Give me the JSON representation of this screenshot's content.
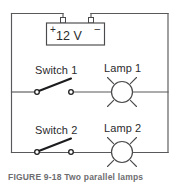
{
  "figure": {
    "caption": "FIGURE 9-18   Two parallel lamps",
    "circuit_type": "parallel circuit"
  },
  "battery": {
    "voltage_label": "12 V",
    "positive_sign": "+",
    "negative_sign": "–"
  },
  "branches": [
    {
      "switch_label": "Switch 1",
      "lamp_label": "Lamp 1",
      "switch_state": "open"
    },
    {
      "switch_label": "Switch 2",
      "lamp_label": "Lamp 2",
      "switch_state": "open"
    }
  ],
  "colors": {
    "wire": "#59595b",
    "symbol": "#3a3a3c",
    "text": "#2b2b2d",
    "caption": "#6d6d70",
    "background": "#ffffff"
  }
}
